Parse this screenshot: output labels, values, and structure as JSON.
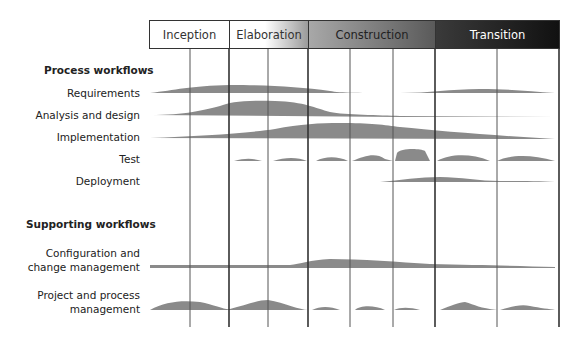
{
  "phases": [
    {
      "label": "Inception",
      "start": 149,
      "end": 229
    },
    {
      "label": "Elaboration",
      "start": 229,
      "end": 308
    },
    {
      "label": "Construction",
      "start": 308,
      "end": 435
    },
    {
      "label": "Transition",
      "start": 435,
      "end": 560
    }
  ],
  "iteration_lines": [
    190,
    229,
    268,
    308,
    350,
    393,
    435,
    497,
    559
  ],
  "major_lines": [
    229,
    308,
    435,
    559
  ],
  "sections": {
    "process_title": "Process workflows",
    "supporting_title": "Supporting workflows"
  },
  "workflows": [
    {
      "label": "Requirements",
      "y": 93
    },
    {
      "label": "Analysis and design",
      "y": 115
    },
    {
      "label": "Implementation",
      "y": 138
    },
    {
      "label": "Test",
      "y": 160
    },
    {
      "label": "Deployment",
      "y": 182
    }
  ],
  "supporting": [
    {
      "label_line1": "Configuration and",
      "label_line2": "change management",
      "y": 267
    },
    {
      "label_line1": "Project and process",
      "label_line2": "management",
      "y": 310
    }
  ],
  "colors": {
    "hump": "#8a8a8a",
    "line": "#444444",
    "phase_text_dark": "#333333",
    "phase_text_light": "#ffffff"
  }
}
